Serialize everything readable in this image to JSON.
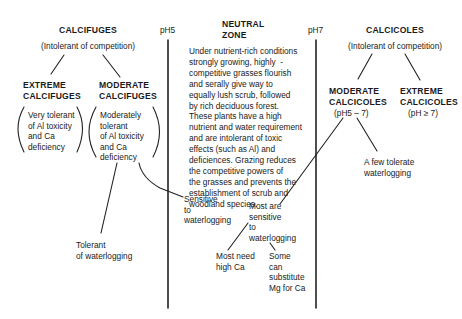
{
  "calcifuges": {
    "title": "CALCIFUGES",
    "subtitle": "(Intolerant of competition)",
    "extreme": {
      "title_line1": "EXTREME",
      "title_line2": "CALCIFUGES",
      "desc": "Very tolerant\nof Al toxicity\nand Ca\ndeficiency"
    },
    "moderate": {
      "title_line1": "MODERATE",
      "title_line2": "CALCIFUGES",
      "desc": "Moderately\ntolerant\nof Al toxicity\nand Ca\ndeficiency",
      "branch_tolerant": "Tolerant\nof waterlogging",
      "branch_sensitive": "Sensitive\nto\nwaterlogging"
    }
  },
  "ph_markers": {
    "left": "pH5",
    "right": "pH7"
  },
  "neutral_zone": {
    "title_line1": "NEUTRAL",
    "title_line2": "ZONE",
    "body": "Under nutrient-rich conditions\nstrongly growing, highly  -\ncompetitive grasses flourish\nand serally give way to\nequally lush scrub, followed\nby rich deciduous forest.\nThese plants have a high\nnutrient and water requirement\nand are intolerant of toxic\neffects (such as Al) and\ndeficiences. Grazing reduces\nthe competitive powers of\nthe grasses and prevents the\nestablishment of scrub and\nwoodland species."
  },
  "calcicoles": {
    "title": "CALCICOLES",
    "subtitle": "(Intolerant of competition)",
    "moderate": {
      "title_line1": "MODERATE",
      "title_line2": "CALCICOLES",
      "range": "(pH5 – 7)",
      "branch_few": "A few tolerate\nwaterlogging",
      "branch_most": "Most are\nsensitive\nto\nwaterlogging",
      "sub_need_ca": "Most need\nhigh Ca",
      "sub_mg": "Some\ncan\nsubstitute\nMg for Ca"
    },
    "extreme": {
      "title_line1": "EXTREME",
      "title_line2": "CALCICOLES",
      "range": "(pH ≥ 7)"
    }
  }
}
